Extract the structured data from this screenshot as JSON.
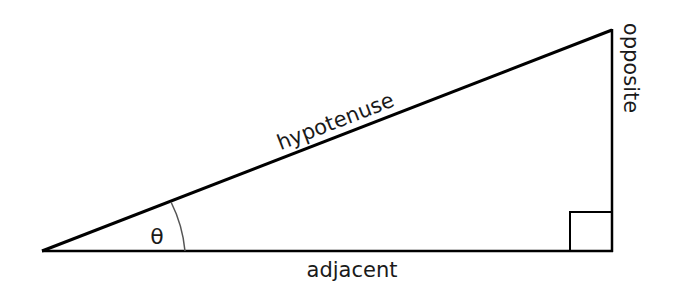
{
  "diagram": {
    "type": "right-triangle",
    "labels": {
      "hypotenuse": "hypotenuse",
      "opposite": "opposite",
      "adjacent": "adjacent",
      "angle": "θ"
    },
    "colors": {
      "stroke": "#000000",
      "text": "#1a1a1a",
      "arc": "#555555",
      "background": "#ffffff"
    }
  }
}
